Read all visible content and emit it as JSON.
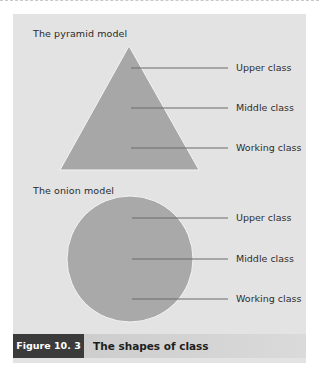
{
  "figure": {
    "number_label": "Figure 10. 3",
    "title": "The shapes of class"
  },
  "colors": {
    "panel": "#e3e3e3",
    "shape_fill": "#a7a7a7",
    "leader_line": "#6a6a6a",
    "badge": "#3b3b3b"
  },
  "models": [
    {
      "title": "The pyramid model",
      "shape": "triangle",
      "labels": [
        "Upper class",
        "Middle class",
        "Working class"
      ]
    },
    {
      "title": "The onion model",
      "shape": "circle",
      "labels": [
        "Upper class",
        "Middle class",
        "Working class"
      ]
    }
  ]
}
